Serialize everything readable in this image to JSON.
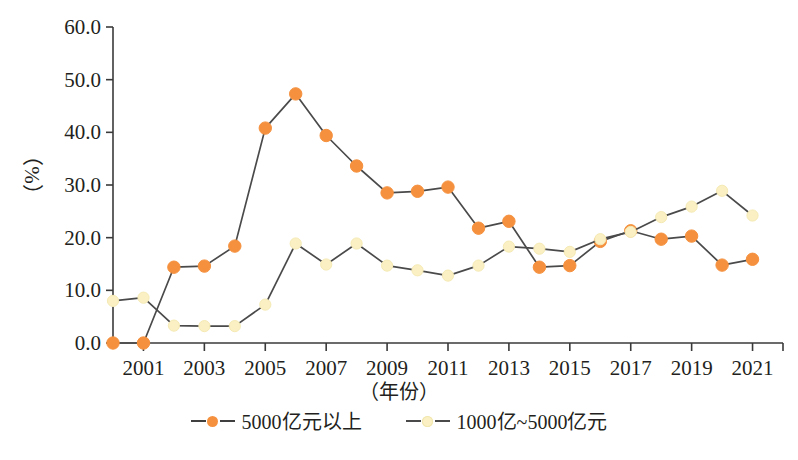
{
  "chart_data": {
    "type": "line",
    "title": "",
    "xlabel": "（年份）",
    "ylabel": "（%）",
    "x": [
      2000,
      2001,
      2002,
      2003,
      2004,
      2005,
      2006,
      2007,
      2008,
      2009,
      2010,
      2011,
      2012,
      2013,
      2014,
      2015,
      2016,
      2017,
      2018,
      2019,
      2020,
      2021
    ],
    "xlim": [
      2000,
      2022
    ],
    "ylim": [
      0,
      60
    ],
    "yticks": [
      "0.0",
      "10.0",
      "20.0",
      "30.0",
      "40.0",
      "50.0",
      "60.0"
    ],
    "ytick_values": [
      0,
      10,
      20,
      30,
      40,
      50,
      60
    ],
    "xticks": [
      "2001",
      "2003",
      "2005",
      "2007",
      "2009",
      "2011",
      "2013",
      "2015",
      "2017",
      "2019",
      "2021"
    ],
    "xtick_values": [
      2001,
      2003,
      2005,
      2007,
      2009,
      2011,
      2013,
      2015,
      2017,
      2019,
      2021
    ],
    "grid": false,
    "legend_position": "bottom",
    "series": [
      {
        "name": "5000亿元以上",
        "marker": "circle-filled",
        "color": "#F5913E",
        "line_color": "#4a4a4a",
        "line_style": "solid",
        "values": [
          0.0,
          0.0,
          14.4,
          14.6,
          18.4,
          40.8,
          47.3,
          39.4,
          33.6,
          28.5,
          28.8,
          29.6,
          21.8,
          23.1,
          14.4,
          14.7,
          19.3,
          21.3,
          19.7,
          20.3,
          14.8,
          15.9
        ]
      },
      {
        "name": "1000亿~5000亿元",
        "marker": "circle-light",
        "color": "#FAF0C3",
        "line_color": "#4a4a4a",
        "line_style": "dashed",
        "values": [
          8.0,
          8.6,
          3.3,
          3.2,
          3.2,
          7.3,
          18.9,
          14.9,
          18.9,
          14.7,
          13.8,
          12.8,
          14.7,
          18.3,
          17.9,
          17.3,
          19.7,
          21.1,
          23.9,
          25.9,
          28.9,
          24.2
        ]
      }
    ]
  },
  "legend": {
    "entries": [
      {
        "label": "5000亿元以上"
      },
      {
        "label": "1000亿~5000亿元"
      }
    ]
  },
  "axes": {
    "x_title": "（年份）",
    "y_title": "（%）"
  },
  "colors": {
    "series1": "#F5913E",
    "series2": "#FAF0C3",
    "line": "#4a4a4a",
    "axis": "#3a3a3a",
    "text": "#231f20",
    "background": "#ffffff"
  }
}
